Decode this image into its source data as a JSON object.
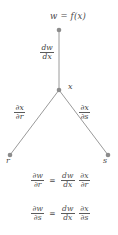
{
  "diagram": {
    "background_color": "#ffffff",
    "line_color": "#8c8c8c",
    "node_color": "#8c8c8c",
    "text_color": "#4a4a4a",
    "nodes": [
      {
        "id": "w",
        "label": "w = f(x)",
        "x": 59,
        "y": 30
      },
      {
        "id": "x",
        "label": "x",
        "x": 59,
        "y": 90
      },
      {
        "id": "r",
        "label": "r",
        "x": 10,
        "y": 155
      },
      {
        "id": "s",
        "label": "s",
        "x": 108,
        "y": 155
      }
    ],
    "edges": [
      {
        "from": "w",
        "to": "x",
        "label_num": "dw",
        "label_den": "dx"
      },
      {
        "from": "x",
        "to": "r",
        "label_num": "∂x",
        "label_den": "∂r"
      },
      {
        "from": "x",
        "to": "s",
        "label_num": "∂x",
        "label_den": "∂s"
      }
    ]
  },
  "equations": [
    {
      "lhs_num": "∂w",
      "lhs_den": "∂r",
      "relation": "=",
      "rhs1_num": "dw",
      "rhs1_den": "dx",
      "rhs2_num": "∂x",
      "rhs2_den": "∂r"
    },
    {
      "lhs_num": "∂w",
      "lhs_den": "∂s",
      "relation": "=",
      "rhs1_num": "dw",
      "rhs1_den": "dx",
      "rhs2_num": "∂x",
      "rhs2_den": "∂s"
    }
  ]
}
